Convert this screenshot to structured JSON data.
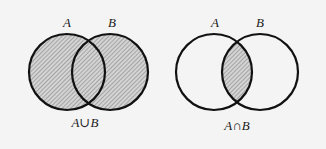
{
  "diagrams": [
    {
      "id": "union",
      "set_a_label": "A",
      "set_b_label": "B",
      "caption_left": "A",
      "caption_op": "∪",
      "caption_right": "B",
      "caption": "A∪B",
      "shaded_region": "A union B (both circles entirely)"
    },
    {
      "id": "intersection",
      "set_a_label": "A",
      "set_b_label": "B",
      "caption_left": "A",
      "caption_op": "∩",
      "caption_right": "B",
      "caption": "A∩B",
      "shaded_region": "A intersection B (lens overlap only)"
    }
  ],
  "colors": {
    "background": "#f4f4f4",
    "stroke": "#111111",
    "hatch_line": "#7a7a7a",
    "hatch_bg": "#d6d6d6",
    "text": "#1a1a1a"
  }
}
